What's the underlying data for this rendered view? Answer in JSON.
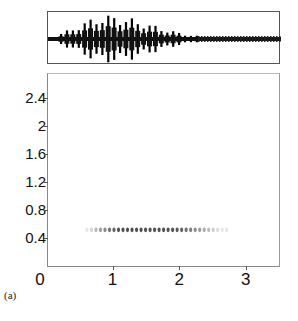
{
  "caption": "(a)",
  "chart_data": [
    {
      "type": "line",
      "title": "",
      "description": "Waveform (amplitude envelope) of a pulsed signal; bursts grow to max near the first third then decay",
      "xlabel": "",
      "ylabel": "",
      "grid": false,
      "pulse_count": 24
    },
    {
      "type": "heatmap",
      "title": "",
      "xlabel": "",
      "ylabel": "",
      "x_ticks": [
        "0",
        "1",
        "2",
        "3"
      ],
      "y_ticks": [
        "0.4",
        "0.8",
        "1.2",
        "1.6",
        "2",
        "2.4"
      ],
      "xlim": [
        0,
        3.5
      ],
      "ylim": [
        0,
        2.75
      ],
      "grid": false,
      "band": {
        "y": 0.53,
        "x_start": 0.6,
        "x_end": 2.7,
        "description": "row of dark spectral dots at ~0.53"
      }
    }
  ],
  "axes": {
    "y": [
      {
        "label": "2.4",
        "value": 2.4
      },
      {
        "label": "2",
        "value": 2.0
      },
      {
        "label": "1.6",
        "value": 1.6
      },
      {
        "label": "1.2",
        "value": 1.2
      },
      {
        "label": "0.8",
        "value": 0.8
      },
      {
        "label": "0.4",
        "value": 0.4
      }
    ],
    "x": [
      {
        "label": "0",
        "value": 0
      },
      {
        "label": "1",
        "value": 1
      },
      {
        "label": "2",
        "value": 2
      },
      {
        "label": "3",
        "value": 3
      }
    ]
  }
}
